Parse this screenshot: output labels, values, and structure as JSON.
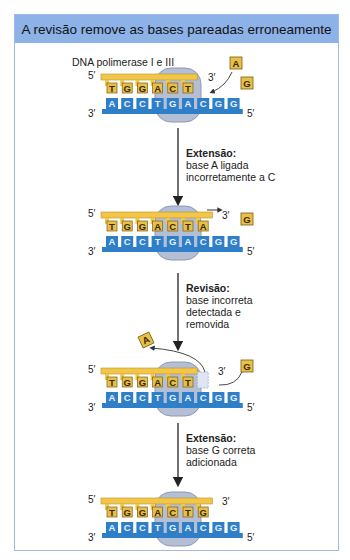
{
  "title": "A revisão remove as bases pareadas erroneamente",
  "enzyme_label": "DNA polimerase I e III",
  "colors": {
    "header_bg": "#8db2e8",
    "panel_border": "#9dbbe6",
    "primer_strand": "#f2c649",
    "template_strand": "#2f7fc8",
    "enzyme": "#b4bfd6",
    "base_box_yellow": "#e7bf4a"
  },
  "strand_ends": {
    "top_left": "5′",
    "top_right": "3′",
    "bottom_left": "3′",
    "bottom_right": "5′"
  },
  "template_sequence": [
    "A",
    "C",
    "C",
    "T",
    "G",
    "A",
    "C",
    "G",
    "G"
  ],
  "steps": [
    {
      "id": "initial",
      "primer_sequence": [
        "T",
        "G",
        "G",
        "A",
        "C",
        "T"
      ],
      "free_bases": [
        "A",
        "G"
      ]
    },
    {
      "id": "extension-incorrect",
      "step_title": "Extensão:",
      "step_text_lines": [
        "base A ligada",
        "incorretamente a C"
      ],
      "primer_sequence": [
        "T",
        "G",
        "G",
        "A",
        "C",
        "T",
        "A"
      ],
      "free_bases": [
        "G"
      ]
    },
    {
      "id": "proofreading",
      "step_title": "Revisão:",
      "step_text_lines": [
        "base incorreta",
        "detectada e",
        "removida"
      ],
      "primer_sequence": [
        "T",
        "G",
        "G",
        "A",
        "C",
        "T"
      ],
      "removed_base": "A",
      "free_bases": [
        "G"
      ]
    },
    {
      "id": "extension-correct",
      "step_title": "Extensão:",
      "step_text_lines": [
        "base G correta",
        "adicionada"
      ],
      "primer_sequence": [
        "T",
        "G",
        "G",
        "A",
        "C",
        "T",
        "G"
      ],
      "free_bases": []
    }
  ]
}
